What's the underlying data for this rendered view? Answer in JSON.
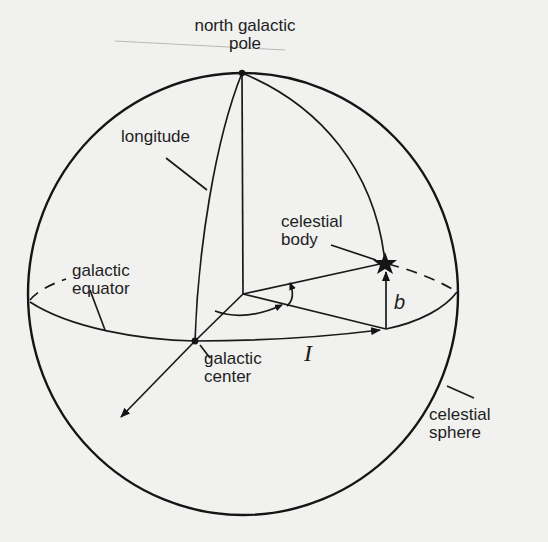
{
  "diagram": {
    "colors": {
      "background": "#f1f1ef",
      "ink": "#151515"
    },
    "labels": {
      "north_galactic_pole": "north galactic\npole",
      "longitude": "longitude",
      "celestial_body": "celestial\nbody",
      "galactic_equator": "galactic\nequator",
      "galactic_center": "galactic\ncenter",
      "celestial_sphere": "celestial\nsphere",
      "longitude_symbol": "I",
      "latitude_symbol": "b"
    },
    "elements": [
      {
        "name": "celestial-sphere",
        "shape": "ellipse",
        "center": [
          243,
          294
        ],
        "rx": 215,
        "ry": 221
      },
      {
        "name": "galactic-equator",
        "shape": "ellipse",
        "center": [
          243,
          294
        ],
        "rx": 214,
        "ry": 48,
        "front": "solid",
        "back": "dashed"
      },
      {
        "name": "north-galactic-pole",
        "shape": "point",
        "at": [
          242,
          73
        ]
      },
      {
        "name": "galactic-center",
        "shape": "point",
        "at": [
          195,
          341
        ]
      },
      {
        "name": "celestial-body",
        "shape": "star",
        "at": [
          385,
          263
        ]
      },
      {
        "name": "polar-axis",
        "shape": "line",
        "from": [
          242,
          73
        ],
        "to": [
          243,
          294
        ]
      },
      {
        "name": "longitude-meridian",
        "shape": "curve",
        "from": [
          242,
          73
        ],
        "to": [
          195,
          341
        ]
      },
      {
        "name": "body-meridian",
        "shape": "curve",
        "from": [
          242,
          73
        ],
        "to": [
          385,
          263
        ]
      },
      {
        "name": "latitude-arrow-b",
        "shape": "arrow",
        "from": [
          386,
          329
        ],
        "to": [
          386,
          270
        ]
      },
      {
        "name": "longitude-arrow-l",
        "shape": "arrow",
        "along": "equator",
        "from": [
          195,
          341
        ],
        "to": [
          380,
          330
        ]
      },
      {
        "name": "axis-toward-observer",
        "shape": "arrow",
        "from": [
          195,
          341
        ],
        "to": [
          120,
          418
        ]
      }
    ]
  }
}
